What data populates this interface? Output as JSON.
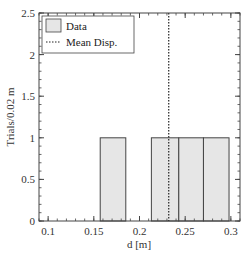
{
  "chart_data": {
    "type": "bar",
    "subtype": "histogram",
    "title": "",
    "xlabel": "d [m]",
    "ylabel": "Trials/0.02 m",
    "xlim": [
      0.09,
      0.31
    ],
    "ylim": [
      0,
      2.5
    ],
    "x_ticks": [
      "0.1",
      "0.15",
      "0.2",
      "0.25",
      "0.3"
    ],
    "y_ticks": [
      "0",
      "0.5",
      "1",
      "1.5",
      "2",
      "2.5"
    ],
    "grid": false,
    "bins": [
      {
        "x0": 0.157,
        "x1": 0.185,
        "count": 1
      },
      {
        "x0": 0.213,
        "x1": 0.243,
        "count": 1
      },
      {
        "x0": 0.243,
        "x1": 0.27,
        "count": 1
      },
      {
        "x0": 0.27,
        "x1": 0.298,
        "count": 1
      }
    ],
    "series": [
      {
        "name": "Data",
        "type": "histogram",
        "color": "#e6e6e6",
        "edge_color": "#444444"
      },
      {
        "name": "Mean Disp.",
        "type": "vline",
        "x": 0.232,
        "style": "dotted",
        "color": "#222222"
      }
    ],
    "legend": {
      "position": "upper left",
      "entries": [
        "Data",
        "Mean Disp."
      ]
    }
  }
}
